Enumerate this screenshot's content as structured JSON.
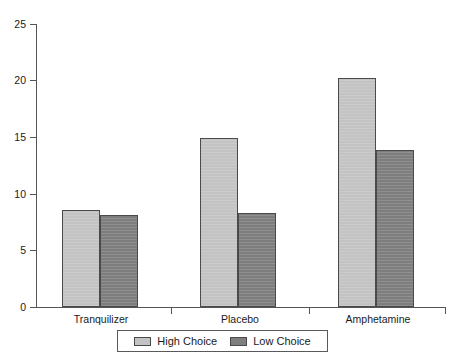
{
  "chart_data": {
    "type": "bar",
    "title": "",
    "subtitle": "",
    "xlabel": "",
    "ylabel": "",
    "categories": [
      "Tranquilizer",
      "Placebo",
      "Amphetamine"
    ],
    "series": [
      {
        "name": "High Choice",
        "color": "#c3c3c3",
        "values": [
          8.6,
          14.9,
          20.2
        ]
      },
      {
        "name": "Low Choice",
        "color": "#7e7e7e",
        "values": [
          8.1,
          8.3,
          13.9
        ]
      }
    ],
    "ylim": [
      0,
      25
    ],
    "yticks": [
      0,
      5,
      10,
      15,
      20,
      25
    ],
    "ytick_labels": [
      "0",
      "5",
      "10",
      "15",
      "20",
      "25"
    ],
    "grid": false,
    "legend_position": "bottom"
  },
  "axis": {
    "y_labels": [
      "25",
      "20",
      "15",
      "10",
      "5",
      "0"
    ]
  },
  "legend": {
    "entries": [
      {
        "label": "High Choice",
        "swatch": "high-choice-swatch"
      },
      {
        "label": "Low Choice",
        "swatch": "low-choice-swatch"
      }
    ]
  }
}
